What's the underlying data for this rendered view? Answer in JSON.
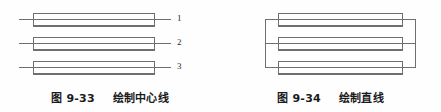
{
  "page": {
    "background_color": "#fefefe",
    "line_color": "#6f6f6f",
    "text_color": "#1b1b1b",
    "width": 441,
    "height": 112
  },
  "figures": [
    {
      "id": "fig-9-33",
      "caption_number": "图 9-33",
      "caption_title": "绘制中心线",
      "description": "three-rectangles-with-centerlines",
      "rectangles": [
        {
          "x": 33,
          "y": 13,
          "width": 122,
          "height": 13
        },
        {
          "x": 33,
          "y": 37,
          "width": 122,
          "height": 13
        },
        {
          "x": 33,
          "y": 61,
          "width": 122,
          "height": 13
        }
      ],
      "centerlines": [
        {
          "x1": 19,
          "y1": 19.5,
          "x2": 171,
          "y2": 19.5
        },
        {
          "x1": 19,
          "y1": 43.5,
          "x2": 171,
          "y2": 43.5
        },
        {
          "x1": 19,
          "y1": 67.5,
          "x2": 171,
          "y2": 67.5
        }
      ],
      "callouts": [
        {
          "label": "1",
          "x": 177,
          "y": 16
        },
        {
          "label": "2",
          "x": 177,
          "y": 40
        },
        {
          "label": "3",
          "x": 177,
          "y": 64
        }
      ]
    },
    {
      "id": "fig-9-34",
      "caption_number": "图 9-34",
      "caption_title": "绘制直线",
      "description": "three-rectangles-joined-by-vertical-lines",
      "rectangles": [
        {
          "x": 58,
          "y": 13,
          "width": 125,
          "height": 13
        },
        {
          "x": 58,
          "y": 37,
          "width": 125,
          "height": 13
        },
        {
          "x": 58,
          "y": 61,
          "width": 125,
          "height": 13
        }
      ],
      "centerlines": [
        {
          "x1": 45,
          "y1": 19.5,
          "x2": 196,
          "y2": 19.5
        },
        {
          "x1": 45,
          "y1": 43.5,
          "x2": 196,
          "y2": 43.5
        },
        {
          "x1": 45,
          "y1": 67.5,
          "x2": 196,
          "y2": 67.5
        }
      ],
      "connectors": [
        {
          "orientation": "vertical",
          "x": 45,
          "y1": 19.5,
          "y2": 67.5,
          "side": "left"
        },
        {
          "orientation": "vertical",
          "x": 196,
          "y1": 19.5,
          "y2": 67.5,
          "side": "right"
        }
      ],
      "callouts": []
    }
  ]
}
